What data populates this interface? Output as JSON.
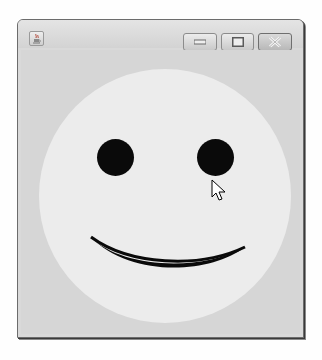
{
  "window": {
    "title": "",
    "icon": "java-cup-icon",
    "controls": {
      "minimize": "minimize-icon",
      "maximize": "maximize-icon",
      "close": "close-icon"
    }
  },
  "canvas": {
    "drawing": "smiley-face",
    "colors": {
      "face": "#ececec",
      "features": "#0a0a0a",
      "background": "#d6d6d6"
    }
  },
  "cursor": {
    "type": "arrow-pointer",
    "x": 231,
    "y": 229
  }
}
